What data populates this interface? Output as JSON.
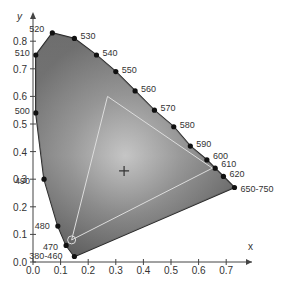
{
  "chart_data": {
    "type": "scatter",
    "title": "",
    "xlabel": "x",
    "ylabel": "y",
    "xlim": [
      0.0,
      0.8
    ],
    "ylim": [
      0.0,
      0.85
    ],
    "x_ticks": [
      "0.0",
      "0.1",
      "0.2",
      "0.3",
      "0.4",
      "0.5",
      "0.6",
      "0.7"
    ],
    "y_ticks": [
      "0.0",
      "0.1",
      "0.2",
      "0.3",
      "0.4",
      "0.5",
      "0.6",
      "0.7",
      "0.8"
    ],
    "spectral_locus": [
      {
        "label": "380-460",
        "x": 0.15,
        "y": 0.02
      },
      {
        "label": "470",
        "x": 0.12,
        "y": 0.06
      },
      {
        "label": "480",
        "x": 0.09,
        "y": 0.13
      },
      {
        "label": "490",
        "x": 0.04,
        "y": 0.3
      },
      {
        "label": "500",
        "x": 0.01,
        "y": 0.54
      },
      {
        "label": "510",
        "x": 0.01,
        "y": 0.75
      },
      {
        "label": "520",
        "x": 0.07,
        "y": 0.83
      },
      {
        "label": "530",
        "x": 0.15,
        "y": 0.81
      },
      {
        "label": "540",
        "x": 0.23,
        "y": 0.75
      },
      {
        "label": "550",
        "x": 0.3,
        "y": 0.69
      },
      {
        "label": "560",
        "x": 0.37,
        "y": 0.62
      },
      {
        "label": "570",
        "x": 0.44,
        "y": 0.55
      },
      {
        "label": "580",
        "x": 0.51,
        "y": 0.49
      },
      {
        "label": "590",
        "x": 0.57,
        "y": 0.42
      },
      {
        "label": "600",
        "x": 0.63,
        "y": 0.37
      },
      {
        "label": "610",
        "x": 0.66,
        "y": 0.34
      },
      {
        "label": "620",
        "x": 0.69,
        "y": 0.31
      },
      {
        "label": "650-750",
        "x": 0.73,
        "y": 0.27
      }
    ],
    "gamut_triangle": [
      {
        "x": 0.27,
        "y": 0.6
      },
      {
        "x": 0.65,
        "y": 0.34
      },
      {
        "x": 0.14,
        "y": 0.08
      }
    ],
    "white_point": {
      "x": 0.33,
      "y": 0.33
    },
    "grid": false
  }
}
